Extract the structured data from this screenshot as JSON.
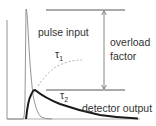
{
  "diagram": {
    "labels": {
      "pulse_input": "pulse input",
      "tau1": "τ",
      "tau1_sub": "1",
      "tau2": "τ",
      "tau2_sub": "2",
      "overload_line1": "overload",
      "overload_line2": "factor",
      "detector_output": "detector output"
    },
    "colors": {
      "axis": "#777777",
      "pulse_input": "#888888",
      "detector_output": "#1a1a1a",
      "tau1_curve": "#aaaaaa",
      "reference_lines": "#444444",
      "arrow": "#666666"
    }
  }
}
